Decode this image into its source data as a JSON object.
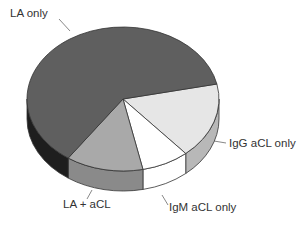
{
  "chart_data": {
    "type": "pie",
    "style": "3d-exploded-ellipse",
    "title": "",
    "categories": [
      "LA only",
      "IgG aCL only",
      "IgM aCL only",
      "LA + aCL"
    ],
    "values": [
      62,
      17,
      8,
      13
    ],
    "units": "approx. percent of patients",
    "colors": {
      "LA only": "#5f5f5f",
      "IgG aCL only": "#e6e6e6",
      "IgM aCL only": "#ffffff",
      "LA + aCL": "#a9a9a9"
    },
    "side_colors": {
      "LA only": "#1e1e1e",
      "IgG aCL only": "#b8b8b8",
      "IgM aCL only": "#ffffff",
      "LA + aCL": "#8a8a8a"
    },
    "legend": "none (callout labels)",
    "labels": [
      {
        "text": "LA only",
        "x": 10,
        "y": 17,
        "anchor": "start"
      },
      {
        "text": "IgG aCL only",
        "x": 229,
        "y": 147,
        "anchor": "start"
      },
      {
        "text": "IgM aCL only",
        "x": 169,
        "y": 211,
        "anchor": "start"
      },
      {
        "text": "LA + aCL",
        "x": 63,
        "y": 208,
        "anchor": "start"
      }
    ]
  }
}
